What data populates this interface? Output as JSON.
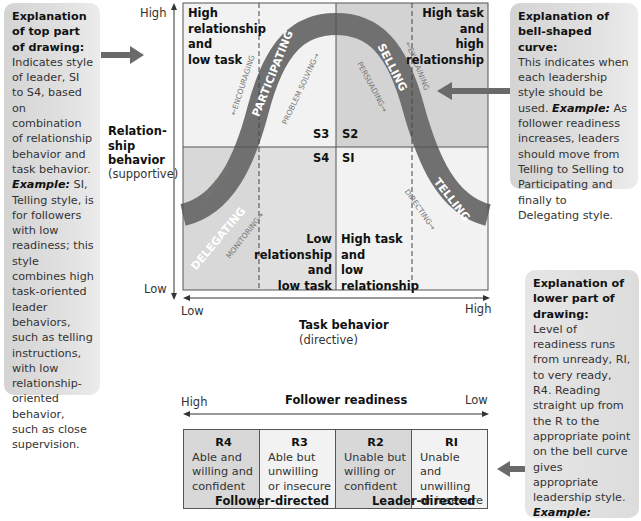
{
  "left_box": {
    "heading": "Explanation of top part of drawing:",
    "body": "Indicates style of leader, SI to S4, based on combination of relationship behavior and task behavior.",
    "example_label": "Example:",
    "example": " SI, Telling style, is for followers with low readiness; this style combines high task-oriented leader behaviors, such as telling instructions, with low relationship-oriented behavior, such as close supervision."
  },
  "right_top_box": {
    "heading": "Explanation of bell-shaped curve:",
    "body": "This indicates when each leadership style should be used.",
    "example_label": "Example:",
    "example": " As follower readiness increases, leaders should move from Telling to Selling to Participating and finally to Delegating style."
  },
  "right_bottom_box": {
    "heading": "Explanation of lower part of drawing:",
    "body": "Level of readiness runs from unready, RI, to very ready, R4. Reading straight up from the R to the appropriate point on the bell curve gives appropriate leadership style.",
    "example_label": "Example:",
    "example": " Straight up from R2 is Selling leadership style."
  },
  "y_axis": {
    "high": "High",
    "low": "Low",
    "title": "Relation-\nship\nbehavior",
    "subtitle": "(supportive)"
  },
  "x_axis": {
    "low": "Low",
    "high": "High",
    "title": "Task behavior",
    "subtitle": "(directive)"
  },
  "quadrants": {
    "top_left": "High\nrelationship\nand\nlow task",
    "top_right": "High task\nand\nhigh\nrelationship",
    "bottom_left": "Low\nrelationship\nand\nlow task",
    "bottom_right": "High task\nand\nlow\nrelationship"
  },
  "style_codes": {
    "s3": "S3",
    "s2": "S2",
    "s4": "S4",
    "s1": "SI"
  },
  "curve": {
    "styles": [
      "DELEGATING",
      "PARTICIPATING",
      "SELLING",
      "TELLING"
    ],
    "behaviors": {
      "observing": "←OBSERVING",
      "monitoring": "MONITORING→",
      "encouraging": "←ENCOURAGING",
      "problem_solving": "PROBLEM SOLVING→",
      "persuading": "PERSUADING→",
      "explaining": "←EXPLAINING",
      "guiding": "←GUIDING",
      "directing": "DIRECTING→"
    }
  },
  "readiness": {
    "high": "High",
    "title": "Follower readiness",
    "low": "Low",
    "levels": [
      {
        "id": "R4",
        "desc": "Able and willing and confident"
      },
      {
        "id": "R3",
        "desc": "Able but unwilling or insecure"
      },
      {
        "id": "R2",
        "desc": "Unable but willing or confident"
      },
      {
        "id": "RI",
        "desc": "Unable and unwilling or insecure"
      }
    ],
    "follower_directed": "Follower-directed",
    "leader_directed": "Leader-directed"
  },
  "colors": {
    "curve": "#707070",
    "quad_light": "#f2f2f2",
    "quad_dark": "#d3d3d3",
    "arrow": "#6a6a6a"
  }
}
